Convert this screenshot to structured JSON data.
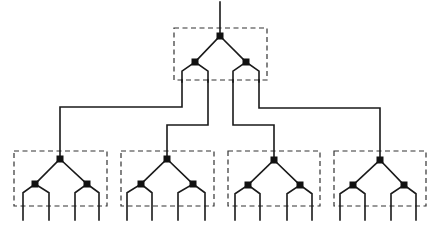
{
  "diagram": {
    "type": "hierarchical tree network",
    "colors": {
      "line": "#1a1a1a",
      "box": "#333333",
      "node": "#111111",
      "background": "#ffffff"
    },
    "top_module": {
      "box": {
        "x": 174,
        "y": 28,
        "w": 93,
        "h": 52
      },
      "root": {
        "x": 220,
        "y": 36
      },
      "input_top_y": 2,
      "children": [
        {
          "x": 195,
          "y": 62
        },
        {
          "x": 246,
          "y": 62
        }
      ],
      "leaf_xs": [
        182,
        208,
        233,
        259
      ],
      "leaf_bottom_y": 82
    },
    "bottom_modules": [
      {
        "box": {
          "x": 14,
          "y": 151,
          "w": 93,
          "h": 55
        },
        "root": {
          "x": 60,
          "y": 159
        },
        "children": [
          {
            "x": 35,
            "y": 184
          },
          {
            "x": 87,
            "y": 184
          }
        ],
        "leaf_xs": [
          23,
          49,
          75,
          99
        ]
      },
      {
        "box": {
          "x": 121,
          "y": 151,
          "w": 93,
          "h": 55
        },
        "root": {
          "x": 167,
          "y": 159
        },
        "children": [
          {
            "x": 141,
            "y": 184
          },
          {
            "x": 193,
            "y": 184
          }
        ],
        "leaf_xs": [
          127,
          152,
          178,
          205
        ]
      },
      {
        "box": {
          "x": 228,
          "y": 151,
          "w": 92,
          "h": 55
        },
        "root": {
          "x": 274,
          "y": 160
        },
        "children": [
          {
            "x": 248,
            "y": 185
          },
          {
            "x": 300,
            "y": 185
          }
        ],
        "leaf_xs": [
          235,
          260,
          287,
          312
        ]
      },
      {
        "box": {
          "x": 334,
          "y": 151,
          "w": 92,
          "h": 55
        },
        "root": {
          "x": 380,
          "y": 160
        },
        "children": [
          {
            "x": 353,
            "y": 185
          },
          {
            "x": 404,
            "y": 185
          }
        ],
        "leaf_xs": [
          340,
          365,
          391,
          416
        ]
      }
    ],
    "leaf_bottom_y": 220,
    "interconnects": [
      {
        "from_leaf": 0,
        "to_module": 0,
        "path": [
          [
            182,
            80
          ],
          [
            182,
            107
          ],
          [
            60,
            107
          ],
          [
            60,
            159
          ]
        ]
      },
      {
        "from_leaf": 1,
        "to_module": 1,
        "path": [
          [
            208,
            80
          ],
          [
            208,
            125
          ],
          [
            167,
            125
          ],
          [
            167,
            159
          ]
        ]
      },
      {
        "from_leaf": 2,
        "to_module": 2,
        "path": [
          [
            233,
            80
          ],
          [
            233,
            125
          ],
          [
            274,
            125
          ],
          [
            274,
            160
          ]
        ]
      },
      {
        "from_leaf": 3,
        "to_module": 3,
        "path": [
          [
            259,
            80
          ],
          [
            259,
            108
          ],
          [
            380,
            108
          ],
          [
            380,
            160
          ]
        ]
      }
    ],
    "node_size": 7
  }
}
